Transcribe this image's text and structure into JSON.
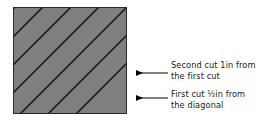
{
  "figure": {
    "name": "cutting-diagram",
    "background_color": "#ffffff"
  },
  "workpiece": {
    "name": "fabric-square",
    "fill_color": "#808080",
    "border_color": "#2b2b2b",
    "x": 13,
    "y": 7,
    "width": 114,
    "height": 107
  },
  "cut_lines": {
    "name": "diagonal-cut-lines",
    "color": "#262626",
    "angle_label": "45",
    "count": 7,
    "spacing": 28
  },
  "annotations": [
    {
      "id": "second-cut",
      "line1": "Second cut 1in from",
      "line2": "the first cut",
      "arrow_tip_x": 129,
      "arrow_tip_y": 73,
      "leader_end_x": 168
    },
    {
      "id": "first-cut",
      "line1": "First cut ½in from",
      "line2": "the diagonal",
      "arrow_tip_x": 129,
      "arrow_tip_y": 98,
      "leader_end_x": 168
    }
  ],
  "leader": {
    "color": "#000000",
    "stroke_width": 1
  }
}
